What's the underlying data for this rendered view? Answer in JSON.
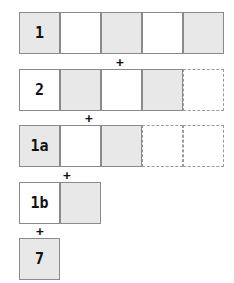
{
  "rows": [
    {
      "label": "1",
      "cells": [
        "shaded",
        "white",
        "shaded",
        "white",
        "shaded"
      ],
      "ghost": 0,
      "top": 12,
      "left": 19
    },
    {
      "label": "2",
      "cells": [
        "white",
        "shaded",
        "white",
        "shaded"
      ],
      "ghost": 1,
      "top": 69,
      "left": 19
    },
    {
      "label": "1a",
      "cells": [
        "shaded",
        "white",
        "shaded"
      ],
      "ghost": 2,
      "top": 125,
      "left": 19
    },
    {
      "label": "1b",
      "cells": [
        "white",
        "shaded"
      ],
      "ghost": 0,
      "top": 182,
      "left": 19
    },
    {
      "label": "7",
      "cells": [
        "shaded"
      ],
      "ghost": 0,
      "top": 238,
      "left": 19
    }
  ],
  "operator": "+",
  "plus_positions": [
    {
      "x": 120,
      "y": 62
    },
    {
      "x": 89,
      "y": 118
    },
    {
      "x": 67,
      "y": 175
    },
    {
      "x": 40,
      "y": 231
    }
  ],
  "colors": {
    "shaded": "#e8e8e8",
    "white": "#ffffff",
    "border": "#8a8a8a"
  }
}
